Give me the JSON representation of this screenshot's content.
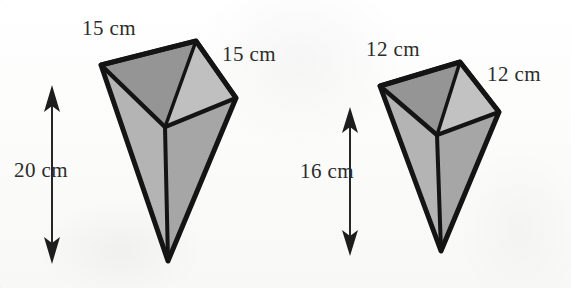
{
  "figure": {
    "background_color": "#fdfdfc",
    "outline_color": "#1a1a1a",
    "face_color_dark": "#9a9a9a",
    "face_color_mid": "#a8a8a8",
    "face_color_light": "#bdbdbd",
    "arrow_color": "#262626"
  },
  "shapes": [
    {
      "name": "left-prism",
      "labels": {
        "top_left": "15 cm",
        "top_right": "15 cm",
        "height": "20 cm"
      },
      "height_arrow": {
        "x": 52,
        "y_top": 86,
        "y_bottom": 263
      },
      "vertices": {
        "top_left": [
          101,
          65
        ],
        "top_back": [
          196,
          41
        ],
        "top_right": [
          236,
          98
        ],
        "top_front": [
          165,
          127
        ],
        "apex": [
          168,
          261
        ]
      }
    },
    {
      "name": "right-prism",
      "labels": {
        "top_left": "12 cm",
        "top_right": "12 cm",
        "height": "16 cm"
      },
      "height_arrow": {
        "x": 350,
        "y_top": 108,
        "y_bottom": 255
      },
      "vertices": {
        "top_left": [
          380,
          86
        ],
        "top_back": [
          460,
          62
        ],
        "top_right": [
          499,
          112
        ],
        "top_front": [
          437,
          135
        ],
        "apex": [
          441,
          251
        ]
      }
    }
  ],
  "labels_layout": {
    "left_top_left": {
      "text": "15 cm",
      "x": 82,
      "y": 16
    },
    "left_top_right": {
      "text": "15 cm",
      "x": 222,
      "y": 42
    },
    "left_height": {
      "text": "20 cm",
      "x": 14,
      "y": 158
    },
    "right_top_left": {
      "text": "12 cm",
      "x": 366,
      "y": 37
    },
    "right_top_right": {
      "text": "12 cm",
      "x": 487,
      "y": 62
    },
    "right_height": {
      "text": "16 cm",
      "x": 300,
      "y": 159
    }
  }
}
